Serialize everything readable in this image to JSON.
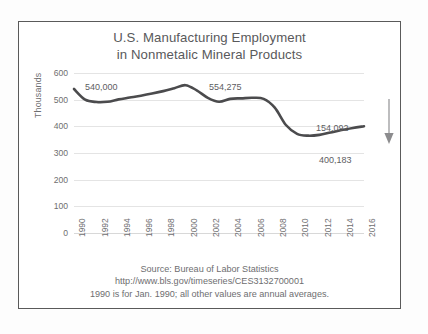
{
  "chart_data": {
    "type": "line",
    "title": "U.S. Manufacturing Employment in Nonmetalic Mineral Products",
    "title_lines": [
      "U.S. Manufacturing Employment",
      "in Nonmetalic Mineral Products"
    ],
    "xlabel": "",
    "ylabel": "Thousands",
    "ylim": [
      0,
      600
    ],
    "ytick_values": [
      0,
      100,
      200,
      300,
      400,
      500,
      600
    ],
    "ytick_labels": [
      "0",
      "100",
      "200",
      "300",
      "400",
      "500",
      "600"
    ],
    "xlim": [
      1990,
      2016
    ],
    "xtick_labels": [
      "1990",
      "1992",
      "1994",
      "1996",
      "1998",
      "2000",
      "2002",
      "2004",
      "2006",
      "2008",
      "2010",
      "2012",
      "2014",
      "2016"
    ],
    "grid": "horizontal",
    "legend": "none",
    "series": [
      {
        "name": "Nonmetalic Mineral Products Employment",
        "color": "#4b4b4d",
        "x": [
          1990,
          1991,
          1992,
          1993,
          1994,
          1995,
          1996,
          1997,
          1998,
          1999,
          2000,
          2001,
          2002,
          2003,
          2004,
          2005,
          2006,
          2007,
          2008,
          2009,
          2010,
          2011,
          2012,
          2013,
          2014,
          2015,
          2016
        ],
        "values": [
          540.0,
          500.0,
          491.0,
          492.0,
          501.0,
          508.0,
          515.0,
          523.0,
          532.0,
          543.0,
          554.3,
          535.0,
          507.0,
          492.0,
          503.0,
          505.0,
          507.0,
          503.0,
          470.0,
          405.0,
          372.0,
          365.0,
          368.0,
          377.0,
          386.0,
          394.0,
          400.2
        ]
      }
    ],
    "annotations": [
      {
        "id": "start",
        "text": "540,000",
        "x": 1990,
        "y": 540.0
      },
      {
        "id": "peak",
        "text": "554,275",
        "x": 2000,
        "y": 554.275
      },
      {
        "id": "drop",
        "text": "154,092",
        "x": 2016,
        "y": 154.092
      },
      {
        "id": "end",
        "text": "400,183",
        "x": 2016,
        "y": 400.183
      }
    ],
    "arrow": {
      "direction": "down",
      "meaning": "decline from 1990 peak to 2016"
    },
    "footer_lines": [
      "Source: Bureau of Labor Statistics",
      "http://www.bls.gov/timeseries/CES3132700001",
      "1990 is for Jan. 1990; all other values are annual averages."
    ]
  },
  "colors": {
    "line": "#4b4b4d",
    "grid": "#e4e4e4",
    "text": "#6e6e70",
    "title": "#59595b",
    "frame": "#5a5a5a",
    "background": "#fdfdfd"
  }
}
